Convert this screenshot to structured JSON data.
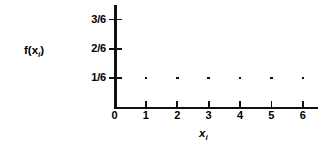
{
  "chart_data": {
    "type": "scatter",
    "title": "",
    "subtitle": "",
    "xlabel": "x_i",
    "ylabel": "f(x_i)",
    "x": [
      1,
      2,
      3,
      4,
      5,
      6
    ],
    "values": [
      0.16667,
      0.16667,
      0.16667,
      0.16667,
      0.16667,
      0.16667
    ],
    "point_value_labels": [
      "1/6",
      "1/6",
      "1/6",
      "1/6",
      "1/6",
      "1/6"
    ],
    "xlim": [
      0,
      6.5
    ],
    "ylim": [
      0,
      0.5833
    ],
    "xticks": [
      0,
      1,
      2,
      3,
      4,
      5,
      6
    ],
    "xtick_labels": [
      "0",
      "1",
      "2",
      "3",
      "4",
      "5",
      "6"
    ],
    "yticks": [
      0.16667,
      0.33333,
      0.5
    ],
    "ytick_labels": [
      "1/6",
      "2/6",
      "3/6"
    ],
    "grid": false,
    "legend": null,
    "marker": "dot",
    "color": "#111111"
  },
  "figure": {
    "background_color": "#ffffff",
    "axis_color": "#111111",
    "axis_labels": {
      "y": {
        "base": "f(x",
        "sub": "i",
        "close": ")"
      },
      "x": {
        "base": "x",
        "sub": "i"
      }
    }
  }
}
